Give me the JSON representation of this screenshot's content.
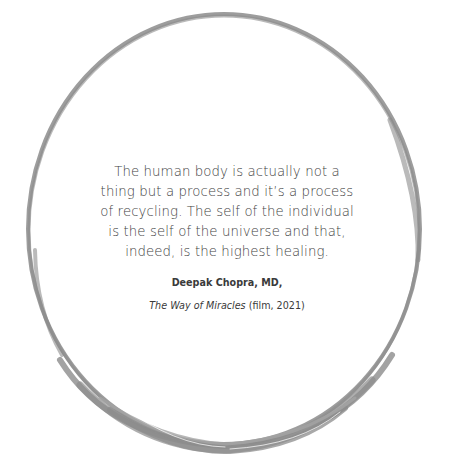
{
  "quote": {
    "text": "The human body is actually not a thing but a process and it’s a process of recycling. The self of the individual is the self of the universe and that, indeed, is the highest healing.",
    "lines": [
      "The human body is actually not a",
      "thing but a process and it’s a process",
      "of recycling. The self of the individual",
      "is the self of the universe and that,",
      "indeed, is the highest healing."
    ]
  },
  "attribution": {
    "author": "Deepak Chopra, MD,",
    "work_title": "The Way of Miracles",
    "work_details": " (film, 2021)"
  },
  "decoration": {
    "ring_icon": "enso-brush-circle-icon",
    "ring_color": "#8a8a8a"
  }
}
